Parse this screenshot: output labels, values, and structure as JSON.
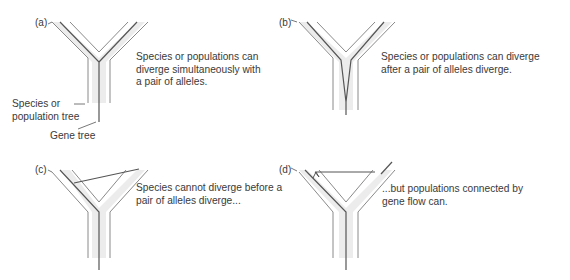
{
  "figure": {
    "panels": [
      {
        "id": "a",
        "label": "(a)",
        "caption_lines": [
          "Species or populations can",
          "diverge simultaneously with",
          "a pair of alleles."
        ],
        "scenario": "gene tree splits at same point as species tree"
      },
      {
        "id": "b",
        "label": "(b)",
        "caption_lines": [
          "Species or populations can diverge",
          "after a pair of alleles diverge."
        ],
        "scenario": "gene tree splits below species split"
      },
      {
        "id": "c",
        "label": "(c)",
        "caption_lines": [
          "Species cannot diverge before a",
          "pair of alleles diverge..."
        ],
        "scenario": "gene lineage crossing between species branches (not allowed)"
      },
      {
        "id": "d",
        "label": "(d)",
        "caption_lines": [
          "...but populations connected by",
          "gene flow can."
        ],
        "scenario": "gene lineage moves between populations via gene flow"
      }
    ],
    "annotations": {
      "species_tree_label_lines": [
        "Species or",
        "population tree"
      ],
      "gene_tree_label": "Gene tree"
    },
    "colors": {
      "tree_fill": "#ececec",
      "tree_outline": "#8a8a8a",
      "gene_line": "#555555",
      "text": "#3a3a3a"
    }
  }
}
